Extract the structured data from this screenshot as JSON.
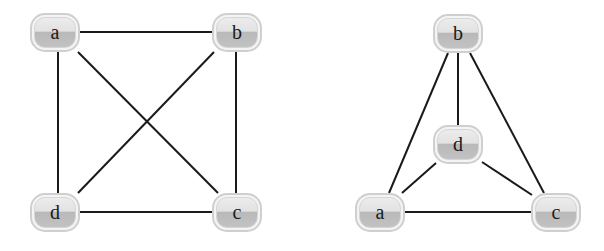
{
  "diagrams": [
    {
      "name": "left-graph",
      "layout": "square-with-diagonals",
      "nodes": [
        {
          "id": "a",
          "label": "a",
          "x": 55,
          "y": 32
        },
        {
          "id": "b",
          "label": "b",
          "x": 237,
          "y": 32
        },
        {
          "id": "c",
          "label": "c",
          "x": 237,
          "y": 213
        },
        {
          "id": "d",
          "label": "d",
          "x": 55,
          "y": 213
        }
      ],
      "edges": [
        [
          "a",
          "b"
        ],
        [
          "a",
          "d"
        ],
        [
          "a",
          "c"
        ],
        [
          "b",
          "c"
        ],
        [
          "b",
          "d"
        ],
        [
          "d",
          "c"
        ]
      ]
    },
    {
      "name": "right-graph",
      "layout": "planar-triangle-with-center",
      "nodes": [
        {
          "id": "b",
          "label": "b",
          "x": 458,
          "y": 33
        },
        {
          "id": "d",
          "label": "d",
          "x": 458,
          "y": 145
        },
        {
          "id": "a",
          "label": "a",
          "x": 380,
          "y": 213
        },
        {
          "id": "c",
          "label": "c",
          "x": 556,
          "y": 213
        }
      ],
      "edges": [
        [
          "b",
          "a"
        ],
        [
          "b",
          "d"
        ],
        [
          "b",
          "c"
        ],
        [
          "d",
          "a"
        ],
        [
          "d",
          "c"
        ],
        [
          "a",
          "c"
        ]
      ]
    }
  ],
  "colors": {
    "edge": "#1a1a1a",
    "node_border": "#cfcfcf",
    "node_top": "#ececec",
    "node_bottom": "#b9b9b9",
    "background": "#ffffff"
  }
}
